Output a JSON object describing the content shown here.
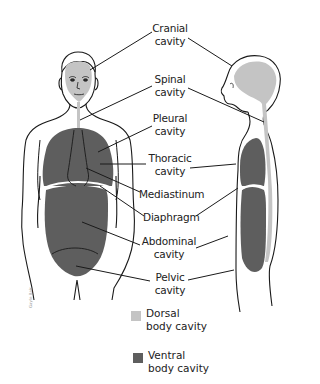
{
  "labels": [
    {
      "id": "cranial",
      "line1": "Cranial",
      "line2": "cavity"
    },
    {
      "id": "spinal",
      "line1": "Spinal",
      "line2": "cavity"
    },
    {
      "id": "pleural",
      "line1": "Pleural",
      "line2": "cavity"
    },
    {
      "id": "thoracic",
      "line1": "Thoracic",
      "line2": "cavity"
    },
    {
      "id": "mediastinum",
      "line1": "Mediastinum",
      "line2": ""
    },
    {
      "id": "diaphragm",
      "line1": "Diaphragm",
      "line2": ""
    },
    {
      "id": "abdominal",
      "line1": "Abdominal",
      "line2": "cavity"
    },
    {
      "id": "pelvic",
      "line1": "Pelvic",
      "line2": "cavity"
    }
  ],
  "legend": [
    {
      "name": "Dorsal",
      "line2": "body cavity",
      "color": "#c4c4c4"
    },
    {
      "name": "Ventral",
      "line2": "body cavity",
      "color": "#5e5e5e"
    }
  ],
  "credit": "Gayle Bair",
  "colors": {
    "dorsal": "#c4c4c4",
    "ventral": "#5e5e5e",
    "outline": "#1a1a1a"
  }
}
